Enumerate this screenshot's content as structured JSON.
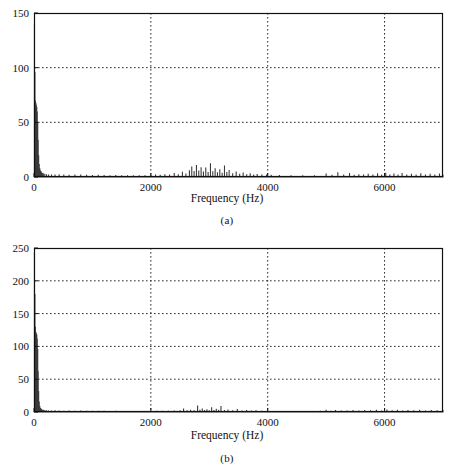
{
  "figure": {
    "background": "#ffffff",
    "ink": "#111111",
    "grid_color": "#2b2b2b",
    "trace_color": "#3a3a3a"
  },
  "panels": [
    {
      "id": "a",
      "caption": "(a)",
      "axis_title": "Frequency (Hz)",
      "frame": {
        "left": 34,
        "top": 13,
        "right": 443,
        "bottom": 177
      }
    },
    {
      "id": "b",
      "caption": "(b)",
      "axis_title": "Frequency (Hz)",
      "frame": {
        "left": 34,
        "top": 248,
        "right": 443,
        "bottom": 412
      }
    }
  ],
  "chart_data": [
    {
      "type": "line",
      "panel": "a",
      "title": "",
      "subtitle": "",
      "xlabel": "Frequency (Hz)",
      "ylabel": "",
      "caption": "(a)",
      "xlim": [
        0,
        7000
      ],
      "ylim": [
        0,
        150
      ],
      "xticks": [
        0,
        2000,
        4000,
        6000
      ],
      "xticklabels": [
        "0",
        "2000",
        "4000",
        "6000"
      ],
      "yticks": [
        0,
        50,
        100,
        150
      ],
      "yticklabels": [
        "0",
        "50",
        "100",
        "150"
      ],
      "grid": true,
      "grid_style": "dotted",
      "legend": null,
      "series": [
        {
          "name": "magnitude spectrum",
          "x": [
            8,
            16,
            24,
            32,
            40,
            48,
            56,
            64,
            72,
            80,
            90,
            100,
            112,
            125,
            140,
            160,
            185,
            215,
            250,
            300,
            360,
            430,
            510,
            600,
            700,
            800,
            900,
            1000,
            1100,
            1200,
            1300,
            1400,
            1500,
            1600,
            1700,
            1800,
            1900,
            2000,
            2080,
            2160,
            2240,
            2320,
            2400,
            2470,
            2540,
            2600,
            2660,
            2700,
            2740,
            2780,
            2820,
            2860,
            2900,
            2940,
            2980,
            3020,
            3060,
            3100,
            3140,
            3180,
            3220,
            3260,
            3300,
            3340,
            3400,
            3460,
            3520,
            3580,
            3640,
            3700,
            3760,
            3820,
            3900,
            3980,
            4060,
            4200,
            4400,
            4600,
            4800,
            5000,
            5100,
            5200,
            5300,
            5400,
            5480,
            5560,
            5640,
            5720,
            5800,
            5880,
            5950,
            6020,
            6090,
            6160,
            6230,
            6300,
            6380,
            6460,
            6540,
            6620,
            6700,
            6780,
            6860,
            6940,
            7000
          ],
          "y": [
            140,
            96,
            70,
            68,
            66,
            64,
            60,
            50,
            34,
            20,
            12,
            8,
            6,
            5,
            4,
            3.5,
            3,
            2.6,
            2.4,
            2.2,
            2.4,
            2.6,
            2.2,
            2.0,
            2.2,
            2.4,
            2.0,
            1.8,
            2.0,
            1.8,
            1.6,
            1.8,
            1.6,
            1.5,
            1.6,
            1.5,
            1.6,
            1.8,
            2.4,
            2.0,
            2.6,
            2.2,
            3.6,
            2.6,
            4.8,
            3.2,
            6.2,
            9.5,
            5.4,
            11.0,
            6.0,
            9.0,
            5.0,
            8.8,
            4.6,
            12.5,
            5.2,
            8.0,
            4.4,
            7.2,
            4.0,
            10.6,
            4.6,
            6.4,
            3.4,
            5.0,
            3.0,
            4.2,
            2.6,
            3.4,
            2.4,
            2.8,
            2.2,
            2.4,
            2.0,
            1.8,
            1.6,
            1.6,
            1.7,
            3.2,
            2.0,
            4.4,
            2.2,
            3.6,
            2.0,
            2.6,
            2.2,
            3.0,
            2.4,
            3.4,
            2.2,
            3.8,
            2.4,
            3.2,
            2.2,
            3.6,
            2.4,
            3.0,
            2.2,
            3.4,
            2.2,
            3.0,
            2.4,
            3.2,
            2.0
          ]
        }
      ],
      "annotations": [
        {
          "text": "DC / low-frequency peak reaches ~140",
          "x": 8,
          "y": 140
        },
        {
          "text": "voiced harmonic cluster 2400-3600 Hz",
          "x": 3000,
          "y": 12
        }
      ]
    },
    {
      "type": "line",
      "panel": "b",
      "title": "",
      "subtitle": "",
      "xlabel": "Frequency (Hz)",
      "ylabel": "",
      "caption": "(b)",
      "xlim": [
        0,
        7000
      ],
      "ylim": [
        0,
        250
      ],
      "xticks": [
        0,
        2000,
        4000,
        6000
      ],
      "xticklabels": [
        "0",
        "2000",
        "4000",
        "6000"
      ],
      "yticks": [
        0,
        50,
        100,
        150,
        200,
        250
      ],
      "yticklabels": [
        "0",
        "50",
        "100",
        "150",
        "200",
        "250"
      ],
      "grid": true,
      "grid_style": "dotted",
      "legend": null,
      "series": [
        {
          "name": "magnitude spectrum",
          "x": [
            8,
            16,
            24,
            32,
            40,
            48,
            56,
            64,
            72,
            80,
            90,
            100,
            112,
            125,
            140,
            160,
            185,
            215,
            250,
            300,
            360,
            430,
            510,
            600,
            700,
            800,
            900,
            1000,
            1100,
            1200,
            1300,
            1400,
            1500,
            1600,
            1700,
            1800,
            1900,
            2000,
            2100,
            2200,
            2300,
            2400,
            2500,
            2560,
            2620,
            2680,
            2740,
            2800,
            2840,
            2880,
            2920,
            2960,
            3000,
            3040,
            3080,
            3120,
            3160,
            3200,
            3260,
            3320,
            3400,
            3480,
            3560,
            3640,
            3720,
            3800,
            3900,
            4000,
            4150,
            4300,
            4500,
            4700,
            4900,
            5000,
            5080,
            5160,
            5260,
            5360,
            5460,
            5560,
            5660,
            5760,
            5860,
            5950,
            6040,
            6130,
            6220,
            6310,
            6400,
            6500,
            6600,
            6700,
            6800,
            6900,
            7000
          ],
          "y": [
            244,
            180,
            130,
            122,
            120,
            118,
            112,
            96,
            62,
            32,
            16,
            9,
            6,
            5,
            4,
            3.5,
            3,
            2.6,
            2.4,
            2.2,
            2.6,
            2.2,
            2.0,
            2.2,
            2.0,
            2.2,
            2.0,
            1.8,
            2.0,
            1.8,
            1.6,
            1.8,
            1.6,
            1.5,
            1.6,
            1.5,
            1.6,
            1.6,
            1.8,
            1.8,
            2.0,
            2.2,
            2.6,
            5.2,
            2.8,
            3.4,
            2.6,
            10.0,
            3.4,
            5.4,
            3.0,
            4.2,
            2.8,
            7.2,
            3.2,
            5.0,
            3.4,
            9.2,
            3.0,
            4.0,
            2.6,
            4.6,
            2.4,
            3.0,
            2.2,
            2.6,
            2.0,
            1.8,
            1.6,
            1.5,
            1.5,
            1.6,
            1.8,
            3.4,
            2.0,
            3.0,
            2.2,
            2.4,
            3.0,
            2.2,
            3.2,
            2.6,
            3.6,
            2.4,
            4.0,
            2.6,
            3.4,
            2.4,
            3.2,
            2.6,
            3.4,
            2.4,
            3.0,
            2.6,
            3.2
          ]
        }
      ],
      "annotations": [
        {
          "text": "DC / low-frequency peak reaches ~244",
          "x": 8,
          "y": 244
        },
        {
          "text": "sparse harmonic cluster 2500-3400 Hz",
          "x": 3000,
          "y": 10
        }
      ]
    }
  ]
}
